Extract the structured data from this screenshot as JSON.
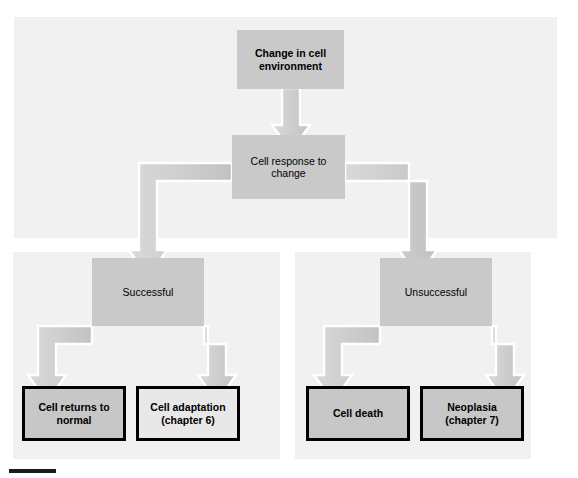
{
  "figure": {
    "colors": {
      "panel_background": "#f1f1f1",
      "process_box_fill": "#c9c9c9",
      "terminal_box_fill_dark": "#c7c7c7",
      "terminal_box_fill_light": "#e8e8e8",
      "arrow_fill": "#d2d2d2",
      "arrow_outline": "#ffffff",
      "text": "#000000",
      "border": "#000000",
      "page_background": "#ffffff"
    }
  },
  "nodes": {
    "change": {
      "label": "Change in cell environment",
      "line1": "Change in cell",
      "line2": "environment"
    },
    "response": {
      "label": "Cell response to change",
      "line1": "Cell response to",
      "line2": "change"
    },
    "successful": {
      "label": "Successful"
    },
    "unsuccessful": {
      "label": "Unsuccessful"
    },
    "returns_to_normal": {
      "label": "Cell returns to normal",
      "line1": "Cell returns to",
      "line2": "normal"
    },
    "adaptation": {
      "label": "Cell adaptation (chapter 6)",
      "line1": "Cell adaptation",
      "line2": "(chapter 6)"
    },
    "cell_death": {
      "label": "Cell death",
      "line1": "Cell death",
      "line2": ""
    },
    "neoplasia": {
      "label": "Neoplasia (chapter 7)",
      "line1": "Neoplasia",
      "line2": "(chapter 7)"
    }
  },
  "edges": [
    {
      "from": "change",
      "to": "response",
      "style": "block-arrow-down"
    },
    {
      "from": "response",
      "to": "successful",
      "style": "block-arrow-elbow-left"
    },
    {
      "from": "response",
      "to": "unsuccessful",
      "style": "block-arrow-elbow-right"
    },
    {
      "from": "successful",
      "to": "returns_to_normal",
      "style": "block-arrow-elbow-left"
    },
    {
      "from": "successful",
      "to": "adaptation",
      "style": "block-arrow-elbow-right"
    },
    {
      "from": "unsuccessful",
      "to": "cell_death",
      "style": "block-arrow-elbow-left"
    },
    {
      "from": "unsuccessful",
      "to": "neoplasia",
      "style": "block-arrow-elbow-right"
    }
  ],
  "icons": {
    "arrow_down": "block-arrow-down-icon"
  }
}
